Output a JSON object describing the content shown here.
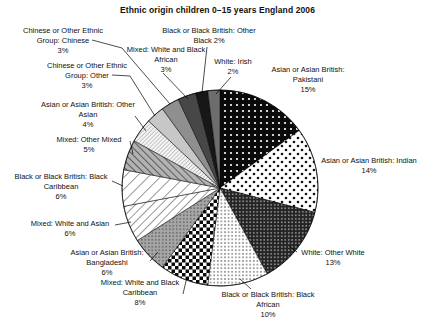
{
  "chart_data": {
    "type": "pie",
    "title": "Ethnic origin children 0–15 years England 2006",
    "direction": "clockwise",
    "start_angle_deg": 0,
    "unit": "percent",
    "slices": [
      {
        "id": "pakistani",
        "label": "Asian or Asian British:\nPakistani",
        "pct_label": "15%",
        "value": 15,
        "fill": {
          "type": "dots",
          "bg": "#0a0a0a",
          "fg": "#ffffff",
          "size": 6,
          "r": 1.1
        }
      },
      {
        "id": "indian",
        "label": "Asian or Asian British: Indian",
        "pct_label": "14%",
        "value": 14,
        "fill": {
          "type": "dots",
          "bg": "#ffffff",
          "fg": "#111111",
          "size": 8,
          "r": 1.3,
          "offset": true
        }
      },
      {
        "id": "other-white",
        "label": "White: Other White",
        "pct_label": "13%",
        "value": 13,
        "fill": {
          "type": "dots",
          "bg": "#242424",
          "fg": "#dddddd",
          "size": 3.5,
          "r": 0.75
        }
      },
      {
        "id": "black-african",
        "label": "Black or Black British: Black\nAfrican",
        "pct_label": "10%",
        "value": 10,
        "fill": {
          "type": "dots",
          "bg": "#ffffff",
          "fg": "#111111",
          "size": 3.6,
          "r": 0.7
        }
      },
      {
        "id": "white-black-caribbean",
        "label": "Mixed: White and Black\nCaribbean",
        "pct_label": "8%",
        "value": 8,
        "fill": {
          "type": "checker",
          "bg": "#ffffff",
          "fg": "#0a0a0a",
          "size": 3.5
        }
      },
      {
        "id": "bangladeshi",
        "label": "Asian or Asian British:\nBangladeshi",
        "pct_label": "6%",
        "value": 6,
        "fill": {
          "type": "dots",
          "bg": "#a6a6a6",
          "fg": "#5c5c5c",
          "size": 3.5,
          "r": 0.8
        }
      },
      {
        "id": "white-asian",
        "label": "Mixed: White and Asian",
        "pct_label": "6%",
        "value": 6,
        "fill": {
          "type": "hatch",
          "bg": "#ffffff",
          "fg": "#1a1a1a",
          "size": 6,
          "angle": 45,
          "w": 0.9
        }
      },
      {
        "id": "black-caribbean",
        "label": "Black or Black British: Black\nCaribbean",
        "pct_label": "6%",
        "value": 6,
        "fill": {
          "type": "hatch",
          "bg": "#ffffff",
          "fg": "#1a1a1a",
          "size": 8.5,
          "angle": 45,
          "w": 0.9
        }
      },
      {
        "id": "other-mixed",
        "label": "Mixed: Other Mixed",
        "pct_label": "5%",
        "value": 5,
        "fill": {
          "type": "hatch",
          "bg": "#b2b2b2",
          "fg": "#2e2e2e",
          "size": 5,
          "angle": 135,
          "w": 1.3
        }
      },
      {
        "id": "other-asian",
        "label": "Asian or Asian British: Other\nAsian",
        "pct_label": "4%",
        "value": 4,
        "fill": {
          "type": "hatch",
          "bg": "#f5f5f5",
          "fg": "#666666",
          "size": 2.8,
          "angle": 45,
          "w": 0.7
        }
      },
      {
        "id": "chinese-other-other",
        "label": "Chinese or Other Ethnic\nGroup: Other",
        "pct_label": "3%",
        "value": 3,
        "fill": {
          "type": "solid",
          "bg": "#c7c7c7"
        }
      },
      {
        "id": "chinese-other-chinese",
        "label": "Chinese or Other Ethnic\nGroup: Chinese",
        "pct_label": "3%",
        "value": 3,
        "fill": {
          "type": "solid",
          "bg": "#8f8f8f"
        }
      },
      {
        "id": "white-black-african",
        "label": "Mixed: White and Black\nAfrican",
        "pct_label": "3%",
        "value": 3,
        "fill": {
          "type": "solid",
          "bg": "#474747"
        }
      },
      {
        "id": "other-black",
        "label": "Black or Black British: Other\nBlack",
        "pct_label": "2%",
        "value": 2,
        "fill": {
          "type": "solid",
          "bg": "#171717"
        }
      },
      {
        "id": "irish",
        "label": "White: Irish",
        "pct_label": "2%",
        "value": 2,
        "fill": {
          "type": "solid",
          "bg": "#6d6d6d"
        }
      }
    ]
  }
}
